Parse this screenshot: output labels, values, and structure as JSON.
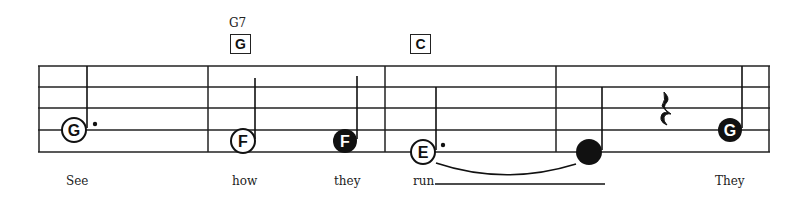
{
  "chords": [
    {
      "name": "G7",
      "box": "G",
      "x": 229
    },
    {
      "name": "",
      "box": "C",
      "x": 410
    }
  ],
  "notes": [
    {
      "letter": "G",
      "x": 74,
      "y": 130,
      "style": "hollow",
      "stem": "up",
      "dotted": true,
      "lyric": "See"
    },
    {
      "letter": "F",
      "x": 243,
      "y": 141,
      "style": "hollow",
      "stem": "up",
      "dotted": false,
      "lyric": "how"
    },
    {
      "letter": "F",
      "x": 345,
      "y": 141,
      "style": "filled",
      "stem": "up",
      "dotted": false,
      "lyric": "they"
    },
    {
      "letter": "E",
      "x": 423,
      "y": 152,
      "style": "hollow",
      "stem": "up",
      "dotted": true,
      "lyric": "run"
    },
    {
      "letter": "",
      "x": 589,
      "y": 152,
      "style": "filled",
      "stem": "up",
      "dotted": false,
      "lyric": ""
    },
    {
      "letter": "G",
      "x": 730,
      "y": 130,
      "style": "filled",
      "stem": "up",
      "dotted": false,
      "lyric": "They"
    }
  ],
  "rest": {
    "type": "quarter",
    "x": 664
  },
  "lyrics": [
    {
      "text": "See",
      "x": 66
    },
    {
      "text": "how",
      "x": 232
    },
    {
      "text": "they",
      "x": 334
    },
    {
      "text": "run",
      "x": 413
    },
    {
      "text": "They",
      "x": 715
    }
  ],
  "colors": {
    "ink": "#111111",
    "paper": "#ffffff"
  }
}
